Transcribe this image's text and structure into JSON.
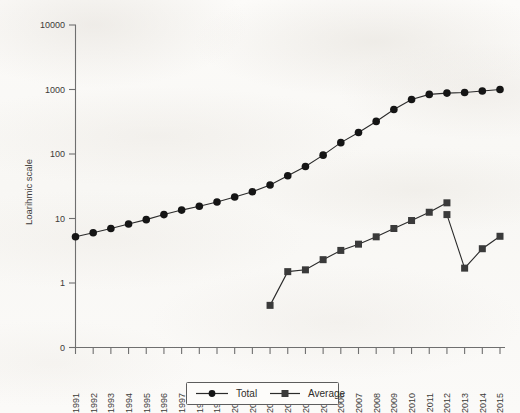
{
  "chart_data": {
    "type": "line",
    "title": "",
    "xlabel": "",
    "ylabel": "Loarihmic scale",
    "y_scale": "log",
    "grid": false,
    "legend_position": "bottom-center",
    "yticks": [
      "0",
      "1",
      "10",
      "100",
      "1000",
      "10000"
    ],
    "ylim": [
      0,
      10000
    ],
    "categories": [
      "1991",
      "1992",
      "1993",
      "1994",
      "1995",
      "1996",
      "1997",
      "1998",
      "1999",
      "2000",
      "2001",
      "2002",
      "2003",
      "2004",
      "2005",
      "2006",
      "2007",
      "2008",
      "2009",
      "2010",
      "2011",
      "2012",
      "2013",
      "2014",
      "2015"
    ],
    "series": [
      {
        "name": "Total",
        "marker": "circle",
        "values": [
          5.2,
          6.0,
          7.0,
          8.2,
          9.6,
          11.5,
          13.5,
          15.5,
          18.0,
          21.5,
          26.0,
          33.0,
          46.0,
          64.0,
          96.0,
          150.0,
          215.0,
          320.0,
          490.0,
          700.0,
          840.0,
          880.0,
          900.0,
          950.0,
          1000.0
        ]
      },
      {
        "name": "Average",
        "marker": "square",
        "values": [
          null,
          null,
          null,
          null,
          null,
          null,
          null,
          null,
          null,
          null,
          null,
          0.45,
          1.5,
          1.6,
          2.3,
          3.2,
          4.0,
          5.2,
          7.0,
          9.3,
          12.5,
          17.5,
          null,
          null,
          null
        ]
      },
      {
        "name": "Average (continued)",
        "marker": "square",
        "values": [
          null,
          null,
          null,
          null,
          null,
          null,
          null,
          null,
          null,
          null,
          null,
          null,
          null,
          null,
          null,
          null,
          null,
          null,
          null,
          null,
          null,
          11.5,
          1.7,
          3.4,
          5.3
        ]
      }
    ],
    "legend": [
      {
        "label": "Total",
        "marker": "circle"
      },
      {
        "label": "Average",
        "marker": "square"
      }
    ],
    "colors": {
      "axis": "#6f6f6f",
      "line": "#2b2b2b",
      "total_marker": "#151515",
      "average_marker": "#3a3a3a",
      "text": "#3c3a38",
      "background": "#fbfaf8"
    }
  }
}
